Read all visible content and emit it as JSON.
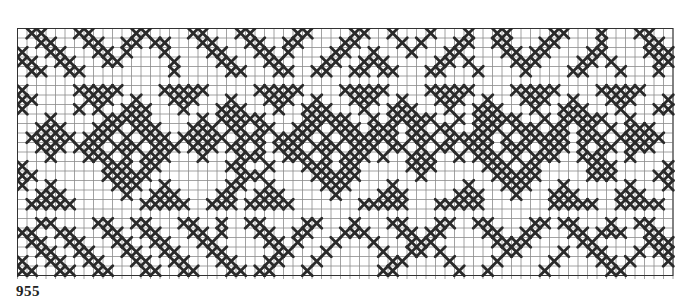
{
  "chart": {
    "label": "955",
    "cell_size": 9.5,
    "cols": 69,
    "rows": 26,
    "grid_color": "#8a8a8a",
    "stitch_color": "#2a2a2a",
    "pattern_rows": [
      ".XX...XX....XX....XX...XX....XX....XX..X...X...X..XX....XX...X...XX..",
      "..XX...XX..XX.XX...XX...XX..XX....XX....X.X...XX..XX...XX....X....XX.",
      "X..XX...XX.X...X....XX...XX.X....XX..X...X...XX....XX.XX....XX....XXX",
      "XX..XX...XX.....X....XX...XX....XX..XXX.....XX.X....XXX....XX.X....XX",
      ".XX..XX.........X.....XX...XX..XX..XX.XX...XX...X....X....XX...X...X.",
      ".....................................................................",
      "X.....XXXXX....XXXXX.....XXXXX....XXXXX....XXXXX....XXXXX....XXXXX...",
      "XX.....XXX..X...XXX...X...XXX..X...XXX..X...XXX..X...XXX..X...XXX...X",
      "X.....X.X..XXX...X...XXX...X..XXX...X..XXX...X..XXX...X..XXX...X...XX",
      "...X.....XXXXX.....X.XXXXX....XXXXX..X.XXXXX..X.XXXXX..X.XXXXX..X....",
      "..XXX...XXX.XXX...XXX.XX.XX..XXX.XXX.XXX.XX.XX..XXX.XXX.XX.XX.X.XXX..",
      ".XXXXX.XXX.X.XXX.XXXXX.XXX.XXXX.X.XXXXXX.XXX.XXXXX.X.XXXXX.XXX.XXXXX.",
      "..XXX.XXX.XXX.XXX.XXX.XX.X.XXX.XXX.XXX.XX.X.XX.XXX.XXX.XXX.X.XX.XXX..",
      "...X...XXX.X.XXX...X...XXX..XXX.X.XXX.X..XXX..X.XXX.X.XXX..XXX..X....",
      "X........XXX.XX.......XX..X...XXX.XX.....XXX.....XXX.XX.....XXX.....X",
      "XX.......XXXXX.........XXX.....XXXXX......X.......XXXXX.....XXX....XX",
      "X..X......XXX..X......XX..X.....XXX....X.......X...XXX...X......X...X",
      "..XXX......X..XXX....XX..XXX.....X....XXX.....XXX...X...XXX....XXX...",
      ".XXXXX.......XXXXX..XXX.XXXXX.......XXXXX...XXXXX.......XXXXX..XXXXX.",
      ".....................................................................",
      "..XX....XX..XX...XX..X..XX....XX...X...XX...XX..XX....XX.XX...X..XX..",
      "XX..XX...XX..XX...XX.X...XX..XX...XXX...XX.XX....XX..XX...XX.XXX..XX.",
      ".XX..XX...XX..XX...XX.....XX.X...X...X...XXX......XXXX.....XX.....XXX",
      "..XX..XX...XX..XX...XX.....XX...X.....X..XX.X......XX....X..XX...X.XX",
      "X..XX..XX...XX..XX...XX...XX...X.......XX....X....X.....X....XX.X...X",
      "XX..XX..XX...XX..XX...XX.XX...X.......XX......X..X.....X......XX....."
    ]
  }
}
